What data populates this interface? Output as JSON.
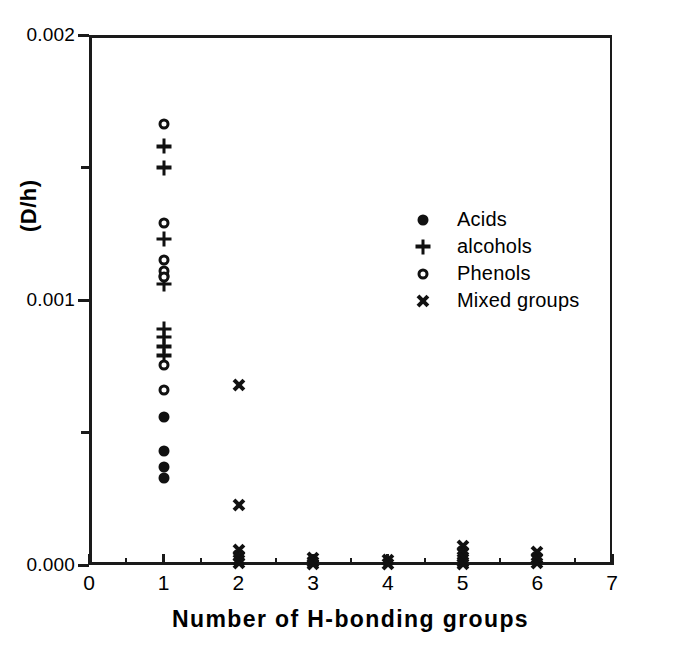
{
  "chart_data": {
    "type": "scatter",
    "title": "",
    "xlabel": "Number of H-bonding groups",
    "ylabel": "(D/h)",
    "xlim": [
      0,
      7
    ],
    "ylim": [
      0.0,
      0.002
    ],
    "grid": false,
    "legend_position": "upper-right-inside",
    "x_ticks": [
      0,
      1,
      2,
      3,
      4,
      5,
      6,
      7
    ],
    "x_ticklabels": [
      "0",
      "1",
      "2",
      "3",
      "4",
      "5",
      "6",
      "7"
    ],
    "x_minor_ticks": [
      0.5,
      1.5,
      2.5,
      3.5,
      4.5,
      5.5,
      6.5
    ],
    "y_ticks": [
      0.0,
      0.001,
      0.002
    ],
    "y_ticklabels": [
      "0.000",
      "0.001",
      "0.002"
    ],
    "y_minor_ticks": [
      0.0005,
      0.0015
    ],
    "series": [
      {
        "name": "Acids",
        "marker": "filled-circle",
        "color": "#111111",
        "points": [
          [
            1,
            0.00109
          ],
          [
            1,
            0.00056
          ],
          [
            1,
            0.00043
          ],
          [
            1,
            0.00037
          ],
          [
            1,
            0.00033
          ]
        ]
      },
      {
        "name": "alcohols",
        "marker": "plus",
        "color": "#111111",
        "points": [
          [
            1,
            0.00158
          ],
          [
            1,
            0.0015
          ],
          [
            1,
            0.00123
          ],
          [
            1,
            0.00106
          ],
          [
            1,
            0.00089
          ],
          [
            1,
            0.00086
          ],
          [
            1,
            0.000825
          ],
          [
            1,
            0.00079
          ]
        ]
      },
      {
        "name": "Phenols",
        "marker": "open-circle",
        "color": "#111111",
        "points": [
          [
            1,
            0.001665
          ],
          [
            1,
            0.00129
          ],
          [
            1,
            0.00115
          ],
          [
            1,
            0.00111
          ],
          [
            1,
            0.001085
          ],
          [
            1,
            0.000755
          ],
          [
            1,
            0.00066
          ]
        ]
      },
      {
        "name": "Mixed groups",
        "marker": "cross",
        "color": "#111111",
        "points": [
          [
            2,
            0.00068
          ],
          [
            2,
            0.000225
          ],
          [
            2,
            5.5e-05
          ],
          [
            2,
            3.5e-05
          ],
          [
            2,
            1.8e-05
          ],
          [
            2,
            6e-06
          ],
          [
            3,
            2.8e-05
          ],
          [
            3,
            1.2e-05
          ],
          [
            3,
            2e-06
          ],
          [
            4,
            2e-05
          ],
          [
            4,
            4e-06
          ],
          [
            5,
            7e-05
          ],
          [
            5,
            5e-05
          ],
          [
            5,
            3e-05
          ],
          [
            5,
            1.2e-05
          ],
          [
            5,
            2e-06
          ],
          [
            6,
            4.8e-05
          ],
          [
            6,
            2.6e-05
          ],
          [
            6,
            8e-06
          ]
        ]
      }
    ]
  },
  "legend": {
    "entries": [
      {
        "label": "Acids",
        "marker": "filled-circle"
      },
      {
        "label": "alcohols",
        "marker": "plus"
      },
      {
        "label": "Phenols",
        "marker": "open-circle"
      },
      {
        "label": "Mixed groups",
        "marker": "cross"
      }
    ]
  },
  "caption": ""
}
